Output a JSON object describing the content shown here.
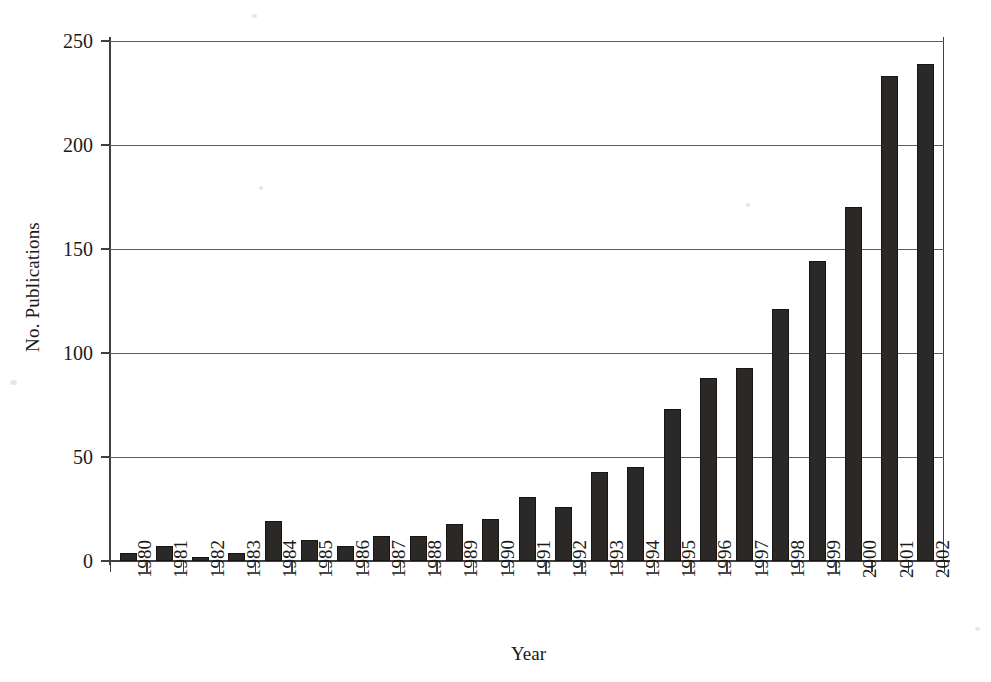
{
  "chart_data": {
    "type": "bar",
    "title": "",
    "xlabel": "Year",
    "ylabel": "No. Publications",
    "categories": [
      "1980",
      "1981",
      "1982",
      "1983",
      "1984",
      "1985",
      "1986",
      "1987",
      "1988",
      "1989",
      "1990",
      "1991",
      "1992",
      "1993",
      "1994",
      "1995",
      "1996",
      "1997",
      "1998",
      "1999",
      "2000",
      "2001",
      "2002"
    ],
    "values": [
      4,
      7,
      2,
      4,
      19,
      10,
      7,
      12,
      12,
      18,
      20,
      31,
      26,
      43,
      45,
      73,
      88,
      93,
      121,
      144,
      170,
      233,
      239
    ],
    "ylim": [
      0,
      250
    ],
    "ytick_labels": [
      "0",
      "50",
      "100",
      "150",
      "200",
      "250"
    ],
    "ytick_values": [
      0,
      50,
      100,
      150,
      200,
      250
    ],
    "grid": "horizontal",
    "legend": "none",
    "bar_color": "#2b2928"
  },
  "figure": {
    "background": "#ffffff",
    "axis_color": "#42403f"
  }
}
